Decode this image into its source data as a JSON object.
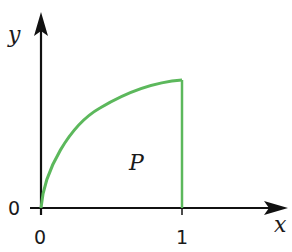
{
  "diagram": {
    "axes": {
      "x_label": "x",
      "y_label": "y",
      "x_ticks": [
        "0",
        "1"
      ],
      "y_ticks": [
        "0"
      ],
      "axis_color": "#111111"
    },
    "region": {
      "label": "P",
      "curve_color": "#5cb85c",
      "description": "Region bounded by an increasing concave curve from the origin to x = 1, the vertical line x = 1, and the x-axis"
    }
  }
}
